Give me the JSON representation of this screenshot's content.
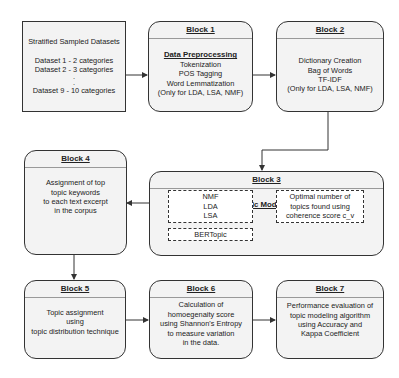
{
  "input_box": {
    "title": "Stratified Sampled Datasets",
    "lines": [
      "Dataset 1 - 2 categories",
      "Dataset 2 - 3 categories",
      ".",
      ".",
      "Dataset 9 - 10 categories"
    ]
  },
  "blocks": [
    {
      "label": "Block 1",
      "subtitle": "Data Preprocessing",
      "lines": [
        "Tokenization",
        "POS Tagging",
        "Word Lemmatization",
        "(Only for LDA, LSA, NMF)"
      ]
    },
    {
      "label": "Block 2",
      "lines": [
        "Dictionary Creation",
        "Bag of Words",
        "TF-IDF",
        "(Only for LDA, LSA, NMF)"
      ]
    },
    {
      "label": "Block 3",
      "subtitle": "Topic Modeling",
      "models": [
        "NMF",
        "LDA",
        "LSA"
      ],
      "bertopic": "BERTopic",
      "optimal": [
        "Optimal number of",
        "topics found using",
        "coherence score c_v"
      ]
    },
    {
      "label": "Block 4",
      "lines": [
        "Assignment of top",
        "topic keywords",
        "to each text excerpt",
        "in the corpus"
      ]
    },
    {
      "label": "Block 5",
      "lines": [
        "Topic assignment",
        "using",
        "topic distribution technique"
      ]
    },
    {
      "label": "Block 6",
      "lines": [
        "Calculation of",
        "homoegenaity score",
        "using Shannon's Entropy",
        "to measure variation",
        "in the data."
      ]
    },
    {
      "label": "Block 7",
      "lines": [
        "Performance evaluation of",
        "topic modeling algorithm",
        "using Accuracy and",
        "Kappa Coefficient"
      ]
    }
  ],
  "colors": {
    "stroke": "#333333",
    "fill": "#f3f3f3",
    "background": "#ffffff"
  }
}
